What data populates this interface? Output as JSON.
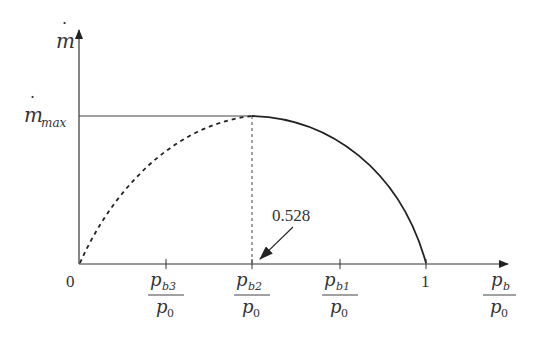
{
  "diagram": {
    "type": "mass-flow-rate-vs-pressure-ratio",
    "y_axis": {
      "label_base": "m",
      "label_dot": "˙",
      "max_label_base": "m",
      "max_label_sub": "max"
    },
    "x_axis": {
      "origin_label": "0",
      "one_label": "1",
      "ticks": [
        {
          "num": "p",
          "num_sub": "b3",
          "den": "p",
          "den_sub": "0"
        },
        {
          "num": "p",
          "num_sub": "b2",
          "den": "p",
          "den_sub": "0"
        },
        {
          "num": "p",
          "num_sub": "b1",
          "den": "p",
          "den_sub": "0"
        }
      ],
      "axis_label": {
        "num": "p",
        "num_sub": "b",
        "den": "p",
        "den_sub": "0"
      }
    },
    "annotation": {
      "critical_ratio": "0.528"
    },
    "curves": {
      "dashed": "theoretical (unchoked extension) from 0 to critical ratio",
      "solid": "actual flow from critical ratio to 1",
      "max_line": "horizontal line at m_max from axis to critical point"
    }
  }
}
